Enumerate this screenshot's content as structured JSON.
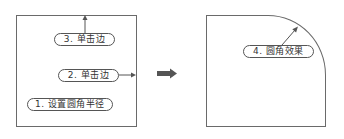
{
  "diagram": {
    "left_panel": {
      "labels": [
        {
          "id": 1,
          "text": "1. 设置圆角半径"
        },
        {
          "id": 2,
          "text": "2. 单击边"
        },
        {
          "id": 3,
          "text": "3. 单击边"
        }
      ]
    },
    "transition_arrow": "arrow-right",
    "right_panel": {
      "labels": [
        {
          "id": 4,
          "text": "4. 圆角效果"
        }
      ]
    },
    "colors": {
      "stroke": "#6a6a6a",
      "label_border": "#555555",
      "text": "#333333",
      "big_arrow": "#555555",
      "background": "#ffffff"
    }
  }
}
